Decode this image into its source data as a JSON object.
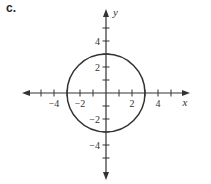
{
  "panel_label": "c.",
  "chart_data": {
    "type": "line",
    "title": "",
    "xlabel": "x",
    "ylabel": "y",
    "xlim": [
      -5.5,
      5.5
    ],
    "ylim": [
      -5.5,
      5.5
    ],
    "x_tick_labels": [
      "-4",
      "-2",
      "2",
      "4"
    ],
    "y_tick_labels": [
      "4",
      "2",
      "-2",
      "-4"
    ],
    "x_ticks": [
      -5,
      -4,
      -3,
      -2,
      -1,
      1,
      2,
      3,
      4,
      5
    ],
    "y_ticks": [
      -5,
      -4,
      -3,
      -2,
      -1,
      1,
      2,
      3,
      4,
      5
    ],
    "grid": false,
    "series": [
      {
        "name": "circle",
        "center": [
          0,
          0
        ],
        "radius": 3
      }
    ],
    "colors": {
      "axis": "#333333",
      "curve": "#333333"
    }
  }
}
